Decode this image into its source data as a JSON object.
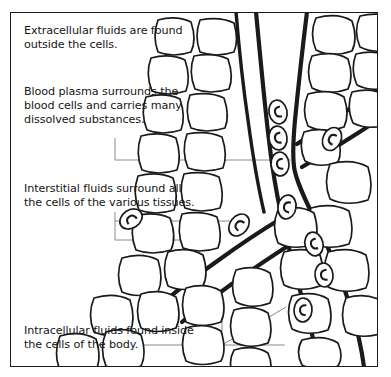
{
  "figure": {
    "border_color": "#1a1a1a",
    "background_color": "#ffffff",
    "ink_color": "#1a1a1a",
    "leader_line_color": "#8a8a8a"
  },
  "captions": {
    "extracellular": "Extracellular fluids are found\noutside the cells.",
    "plasma": "Blood plasma surrounds the\nblood cells and carries many\ndissolved substances.",
    "interstitial": "Interstitial fluids surround all\nthe cells of the various tissues.",
    "intracellular": "Intracellular fluids found inside\nthe cells of the body."
  },
  "diagram": {
    "label": "capillary-and-tissue-cells-illustration",
    "elements": {
      "blood_vessel": "branching-capillary-vessel",
      "red_blood_cells": "red-blood-cell-ovals",
      "tissue_cells": "rounded-tissue-cells",
      "plasma_space": "vessel-lumen"
    },
    "counts": {
      "red_blood_cells": 9,
      "vessel_branches": 3
    }
  },
  "leaders": {
    "plasma": "plasma-leader-line",
    "interstitial_upper": "interstitial-leader-line-upper",
    "interstitial_lower": "interstitial-leader-line-lower",
    "intracellular": "intracellular-leader-lines"
  }
}
